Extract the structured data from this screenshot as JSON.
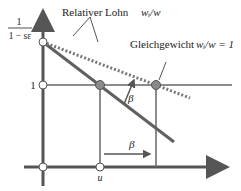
{
  "diagram": {
    "y_tick_top_numerator": "1",
    "y_tick_top_denominator": "1 − sε",
    "y_tick_one": "1",
    "x_tick_u": "u",
    "label_relative_wage": "Relativer Lohn",
    "label_relative_wage_formula": "wᵢ/w",
    "label_equilibrium": "Gleichgewicht",
    "label_equilibrium_formula": "wᵢ/w = 1",
    "beta_upper": "β",
    "beta_lower": "β"
  },
  "colors": {
    "axis": "#555555",
    "solid_line": "#606060",
    "dotted_line": "#707070",
    "filled_point": "#8a8a8a"
  }
}
